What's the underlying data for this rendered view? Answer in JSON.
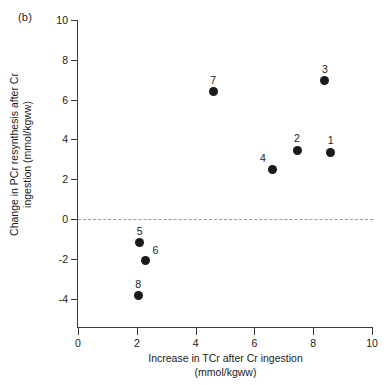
{
  "panel": {
    "label": "(b)"
  },
  "chart_data": {
    "type": "scatter",
    "title": "",
    "xlabel_line1": "Increase in TCr after Cr ingestion",
    "xlabel_line2": "(mmol/kgww)",
    "ylabel_line1": "Change in PCr resynthesis after Cr",
    "ylabel_line2": "ingestion (mmol/kgww)",
    "xlim": [
      0,
      10
    ],
    "ylim": [
      -4.65,
      10
    ],
    "xticks": [
      0,
      2,
      4,
      6,
      8,
      10
    ],
    "xtick_labels": [
      "0",
      "2",
      "4",
      "6",
      "8",
      "10"
    ],
    "yticks": [
      10,
      8,
      6,
      4,
      2,
      0,
      -2,
      -4
    ],
    "ytick_labels": [
      "10",
      "8",
      "6",
      "4",
      "2",
      "0",
      "-2",
      "-4"
    ],
    "grid": false,
    "legend": "none",
    "marker_color": "#1a1a1a",
    "reference_line": {
      "axis": "y",
      "value": 0,
      "style": "dashed",
      "color": "#9a9a9a"
    },
    "points": [
      {
        "label": "1",
        "x": 8.6,
        "y": 3.35,
        "label_pos": "above"
      },
      {
        "label": "2",
        "x": 7.45,
        "y": 3.45,
        "label_pos": "above"
      },
      {
        "label": "3",
        "x": 8.4,
        "y": 6.95,
        "label_pos": "above"
      },
      {
        "label": "4",
        "x": 6.6,
        "y": 2.5,
        "label_pos": "above-left"
      },
      {
        "label": "5",
        "x": 2.1,
        "y": -1.2,
        "label_pos": "above"
      },
      {
        "label": "6",
        "x": 2.3,
        "y": -2.1,
        "label_pos": "above-right"
      },
      {
        "label": "7",
        "x": 4.6,
        "y": 6.4,
        "label_pos": "above"
      },
      {
        "label": "8",
        "x": 2.05,
        "y": -3.85,
        "label_pos": "above"
      }
    ]
  }
}
